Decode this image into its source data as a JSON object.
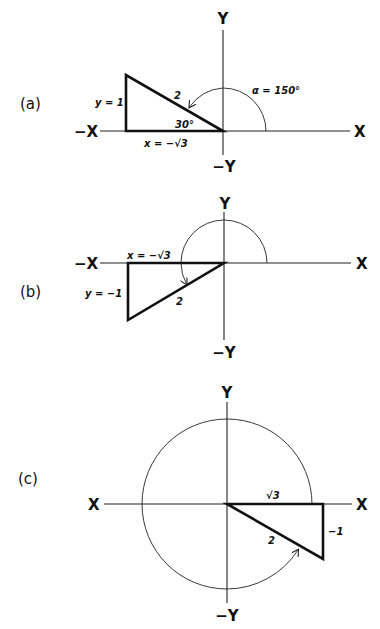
{
  "panels": [
    {
      "id": "a",
      "label": "(a)",
      "axes": {
        "pos_x": "X",
        "neg_x": "−X",
        "pos_y": "Y",
        "neg_y": "−Y"
      },
      "triangle": {
        "hypotenuse": "2",
        "opposite": "y = 1",
        "adjacent": "x = −√3",
        "ref_angle": "30°"
      },
      "angle_label": "α = 150°"
    },
    {
      "id": "b",
      "label": "(b)",
      "axes": {
        "pos_x": "X",
        "neg_x": "−X",
        "pos_y": "Y",
        "neg_y": "−Y"
      },
      "triangle": {
        "hypotenuse": "2",
        "opposite": "y = −1",
        "adjacent": "x = −√3"
      }
    },
    {
      "id": "c",
      "label": "(c)",
      "axes": {
        "pos_x": "X",
        "neg_x": "X",
        "pos_y": "Y",
        "neg_y": "−Y"
      },
      "triangle": {
        "hypotenuse": "2",
        "opposite": "−1",
        "adjacent": "√3"
      }
    }
  ],
  "colors": {
    "ink": "#111111",
    "background": "#ffffff"
  }
}
